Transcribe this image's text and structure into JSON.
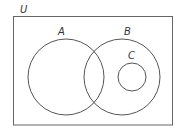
{
  "diagram": {
    "type": "venn",
    "universe_label": "U",
    "sets": [
      {
        "name": "A",
        "label": "A"
      },
      {
        "name": "B",
        "label": "B"
      },
      {
        "name": "C",
        "label": "C"
      }
    ],
    "relationships": [
      "A overlaps B",
      "C is a subset of B",
      "C disjoint from A"
    ],
    "colors": {
      "stroke": "#555555",
      "background": "#ffffff"
    }
  }
}
